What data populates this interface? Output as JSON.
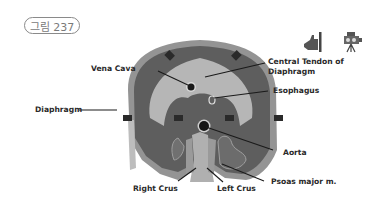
{
  "figure": {
    "badge": "그림 237"
  },
  "toolbar": {
    "icons": [
      {
        "name": "hand-pointer-icon",
        "label": ""
      },
      {
        "name": "video-camera-icon",
        "label": ""
      }
    ]
  },
  "diagram": {
    "colors": {
      "outer_rim": "#8e8e8e",
      "muscle": "#5c5c5c",
      "central_tendon": "#b4b4b4",
      "vessel": "#1a1a1a",
      "crus": "#a8a8a8",
      "arrow": "#2a2a2a",
      "label_text": "#2a2a2a"
    },
    "labels": {
      "vena_cava": "Vena Cava",
      "central_tendon_line1": "Central Tendon of",
      "central_tendon_line2": "Diaphragm",
      "esophagus": "Esophagus",
      "diaphragm": "Diaphragm",
      "aorta": "Aorta",
      "right_crus": "Right Crus",
      "left_crus": "Left Crus",
      "psoas": "Psoas major m."
    }
  }
}
